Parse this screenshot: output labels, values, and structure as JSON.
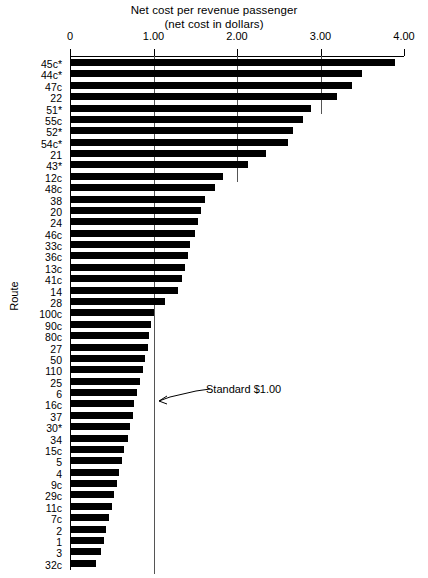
{
  "chart_data": {
    "type": "bar",
    "orientation": "horizontal",
    "title": "Net cost per revenue passenger",
    "subtitle": "(net cost in dollars)",
    "xlabel": "",
    "ylabel": "Route",
    "xlim": [
      0,
      4.0
    ],
    "xticks": [
      "0",
      "1.00",
      "2.00",
      "3.00",
      "4.00"
    ],
    "xtick_values": [
      0,
      1,
      2,
      3,
      4
    ],
    "grid": false,
    "legend": "none",
    "annotations": [
      {
        "label": "Standard $1.00",
        "value": 1.0,
        "type": "reference-line-callout"
      }
    ],
    "categories": [
      "45c*",
      "44c*",
      "47c",
      "22",
      "51*",
      "55c",
      "52*",
      "54c*",
      "21",
      "43*",
      "12c",
      "48c",
      "38",
      "20",
      "24",
      "46c",
      "33c",
      "36c",
      "13c",
      "41c",
      "14",
      "28",
      "100c",
      "90c",
      "80c",
      "27",
      "50",
      "110",
      "25",
      "6",
      "16c",
      "37",
      "30*",
      "34",
      "15c",
      "5",
      "4",
      "9c",
      "29c",
      "11c",
      "7c",
      "2",
      "1",
      "3",
      "32c"
    ],
    "values": [
      3.88,
      3.49,
      3.36,
      3.18,
      2.88,
      2.78,
      2.66,
      2.6,
      2.33,
      2.12,
      1.82,
      1.73,
      1.6,
      1.56,
      1.52,
      1.48,
      1.43,
      1.4,
      1.37,
      1.33,
      1.28,
      1.13,
      0.99,
      0.96,
      0.94,
      0.92,
      0.89,
      0.86,
      0.83,
      0.79,
      0.76,
      0.74,
      0.71,
      0.68,
      0.64,
      0.61,
      0.58,
      0.55,
      0.52,
      0.49,
      0.45,
      0.42,
      0.39,
      0.36,
      0.3
    ],
    "bar_color": "#000000"
  }
}
